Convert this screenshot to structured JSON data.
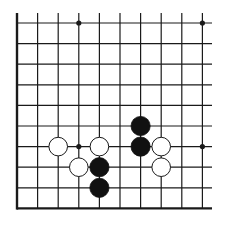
{
  "board": {
    "type": "go-board-fragment",
    "columns": 10,
    "rows": 10,
    "edges": {
      "left": true,
      "bottom": true,
      "top": false,
      "right": false
    },
    "line_color": "#1a1a1a",
    "background": "#ffffff",
    "star_points": [
      [
        3,
        0
      ],
      [
        9,
        0
      ],
      [
        3,
        6
      ],
      [
        9,
        6
      ]
    ],
    "stones": [
      {
        "color": "white",
        "col": 2,
        "row": 6
      },
      {
        "color": "white",
        "col": 4,
        "row": 6
      },
      {
        "color": "white",
        "col": 3,
        "row": 7
      },
      {
        "color": "white",
        "col": 7,
        "row": 6
      },
      {
        "color": "white",
        "col": 7,
        "row": 7
      },
      {
        "color": "black",
        "col": 6,
        "row": 5
      },
      {
        "color": "black",
        "col": 6,
        "row": 6
      },
      {
        "color": "black",
        "col": 4,
        "row": 7
      },
      {
        "color": "black",
        "col": 4,
        "row": 8
      }
    ]
  }
}
